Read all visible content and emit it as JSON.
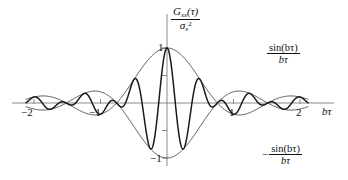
{
  "figure": {
    "title": "",
    "y_axis_label": {
      "numerator_base": "G",
      "numerator_sub": "xx",
      "numerator_arg": "(τ)",
      "denominator_base": "σ",
      "denominator_sub": "x",
      "denominator_sup": "2"
    },
    "x_axis_label": "bτ",
    "upper_envelope_label": {
      "numerator": "sin(bτ)",
      "denominator": "bτ",
      "sign": ""
    },
    "lower_envelope_label": {
      "numerator": "sin(bτ)",
      "denominator": "bτ",
      "sign": "−"
    },
    "x_tick_labels": [
      "−2",
      "−1",
      "1",
      "2"
    ],
    "y_tick_labels": [
      "1",
      "−1"
    ],
    "colors": {
      "signal": "#1a1a1a",
      "envelope": "#3a3a3a",
      "axis": "#8a8a8a",
      "text": "#111111",
      "background": "#ffffff"
    }
  },
  "chart_data": {
    "type": "line",
    "title": "",
    "xlabel": "bτ",
    "ylabel": "G_xx(τ) / σ_x²",
    "xlim": [
      -2.18,
      2.18
    ],
    "ylim": [
      -1.12,
      1.12
    ],
    "grid": false,
    "legend": "inline-annotations",
    "x_ticks": [
      -2,
      -1,
      1,
      2
    ],
    "x_tick_labels": [
      "−2",
      "−1",
      "1",
      "2"
    ],
    "y_ticks": [
      1,
      0.5,
      -0.5,
      -1
    ],
    "y_tick_labels": [
      "1",
      "",
      "",
      "−1"
    ],
    "y_minor_ticks": [
      0.5,
      -0.5
    ],
    "series": [
      {
        "name": "G_xx(τ)/σ_x²",
        "kind": "modulated-cosine",
        "formula": "sin(b*tau)/(b*tau) * cos(omega*b*tau)",
        "omega_cycles_per_unit": 2.0,
        "samples_per_unit": 600,
        "x_start": -2.12,
        "x_end": 2.12,
        "color": "#1a1a1a",
        "width": 1.5
      },
      {
        "name": "sin(bτ)/bτ",
        "kind": "envelope-upper",
        "formula": "sin(b*tau)/(b*tau)",
        "x_start": -2.12,
        "x_end": 2.12,
        "color": "#3a3a3a",
        "width": 0.9
      },
      {
        "name": "−sin(bτ)/bτ",
        "kind": "envelope-lower",
        "formula": "-sin(b*tau)/(b*tau)",
        "x_start": -2.12,
        "x_end": 2.12,
        "color": "#3a3a3a",
        "width": 0.9
      }
    ],
    "envelope_scale": 1.0,
    "envelope_freq": 1.32,
    "annotations": [
      {
        "text": "sin(bτ)/bτ",
        "x": 2.35,
        "y": 0.95
      },
      {
        "text": "−sin(bτ)/bτ",
        "x": 2.3,
        "y": -0.95
      }
    ]
  },
  "geometry": {
    "origin_x": 167,
    "origin_y": 103,
    "unit_x": 66.5,
    "unit_y": 55
  }
}
